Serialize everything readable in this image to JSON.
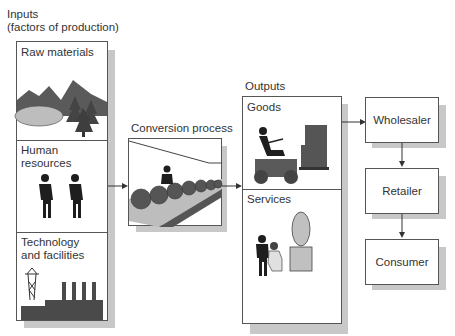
{
  "inputs": {
    "title_line1": "Inputs",
    "title_line2": "(factors of production)",
    "sections": [
      {
        "label": "Raw materials",
        "icon": "mountains-trees-lake-icon"
      },
      {
        "label": "Human resources",
        "icon": "two-people-icon"
      },
      {
        "label_line1": "Technology",
        "label_line2": "and facilities",
        "icon": "power-tower-factory-icon"
      }
    ]
  },
  "conversion": {
    "title": "Conversion process",
    "icon": "conveyor-worker-icon"
  },
  "outputs": {
    "title": "Outputs",
    "sections": [
      {
        "label": "Goods",
        "icon": "forklift-boxes-icon"
      },
      {
        "label": "Services",
        "icon": "barber-customer-icon"
      }
    ]
  },
  "distribution": {
    "boxes": [
      {
        "label": "Wholesaler"
      },
      {
        "label": "Retailer"
      },
      {
        "label": "Consumer"
      }
    ]
  },
  "colors": {
    "border": "#555555",
    "shadow": "#c8c8c8",
    "dark_fill": "#4a4a4a",
    "light_fill": "#bdbdbd"
  }
}
